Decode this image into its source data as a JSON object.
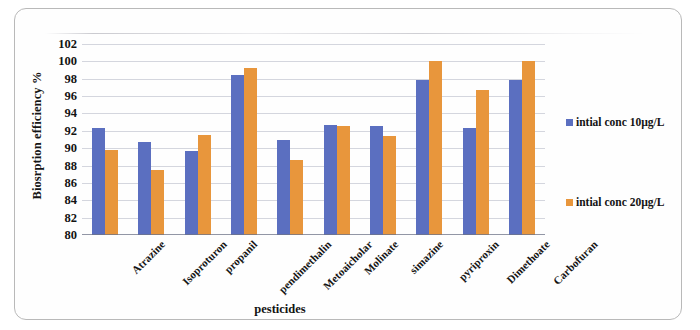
{
  "chart_data": {
    "type": "bar",
    "title": "",
    "xlabel": "pesticides",
    "ylabel": "Biosrption efficiency %",
    "ylim": [
      80,
      102
    ],
    "ytick_step": 2,
    "yticks": [
      102,
      100,
      98,
      96,
      94,
      92,
      90,
      88,
      86,
      84,
      82,
      80
    ],
    "grid": true,
    "legend_position": "right",
    "categories": [
      "Atrazine",
      "Isoproturon",
      "propanil",
      "pendimethalin",
      "Metoaicholar",
      "Molinate",
      "simazine",
      "pyriproxin",
      "Dimethoate",
      "Carbofuran"
    ],
    "series": [
      {
        "name": "intial conc 10µg/L",
        "color": "#5b6fc0",
        "values": [
          92.3,
          90.7,
          89.7,
          98.4,
          91.0,
          92.7,
          92.5,
          97.8,
          92.3,
          97.8
        ]
      },
      {
        "name": "intial conc 20µg/L",
        "color": "#e8963c",
        "values": [
          89.8,
          87.5,
          91.5,
          99.2,
          88.6,
          92.6,
          91.4,
          100.0,
          96.7,
          100.0
        ]
      }
    ]
  },
  "legend": {
    "items": [
      {
        "label": "intial conc 10µg/L"
      },
      {
        "label": "intial conc 20µg/L"
      }
    ]
  }
}
